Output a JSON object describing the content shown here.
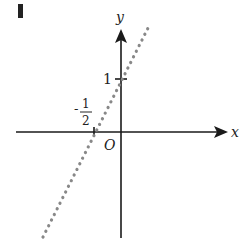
{
  "figure": {
    "panel_label": "I",
    "x_axis_label": "x",
    "y_axis_label": "y",
    "origin_label": "O",
    "y_tick_label": "1",
    "x_tick_label_sign": "-",
    "x_tick_label_num": "1",
    "x_tick_label_den": "2",
    "line": {
      "equation": "y = 2x + 1",
      "style": "dotted",
      "x_intercept": "-1/2",
      "y_intercept": "1"
    },
    "colors": {
      "axis": "#1a1a1a",
      "line": "#888888",
      "panel_label": "#222222"
    }
  }
}
